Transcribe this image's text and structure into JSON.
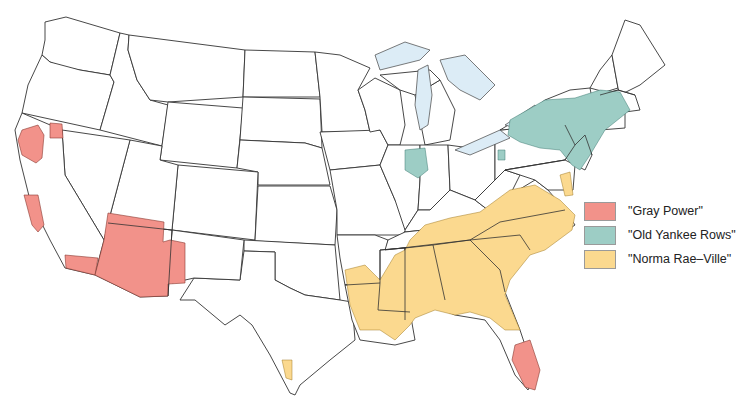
{
  "colors": {
    "gray_power": "#f2928a",
    "old_yankee_rows": "#9dcdc5",
    "norma_rae_ville": "#fbd98f",
    "lake": "#dcecf6",
    "border": "#333333"
  },
  "legend": {
    "items": [
      {
        "label": "\"Gray Power\"",
        "color": "#f2928a"
      },
      {
        "label": "\"Old Yankee Rows\"",
        "color": "#9dcdc5"
      },
      {
        "label": "\"Norma Rae–Ville\"",
        "color": "#fbd98f"
      }
    ]
  },
  "map": {
    "subject": "Contiguous United States",
    "regions": {
      "gray_power": [
        "Northern California (Sacramento/Reno area)",
        "Coastal California",
        "Southern California",
        "Arizona",
        "Western New Mexico",
        "Florida"
      ],
      "old_yankee_rows": [
        "Northern Illinois / Indiana (Chicago area)",
        "New York",
        "Pennsylvania (east)",
        "New Jersey",
        "Connecticut",
        "Massachusetts",
        "Rhode Island",
        "Western Pennsylvania patch"
      ],
      "norma_rae_ville": [
        "Delaware",
        "Virginia",
        "North Carolina",
        "South Carolina",
        "Georgia",
        "Alabama",
        "Mississippi",
        "Louisiana",
        "Tennessee",
        "Kentucky (south)",
        "East Texas",
        "Arkansas (south)",
        "South Texas patch"
      ]
    }
  }
}
